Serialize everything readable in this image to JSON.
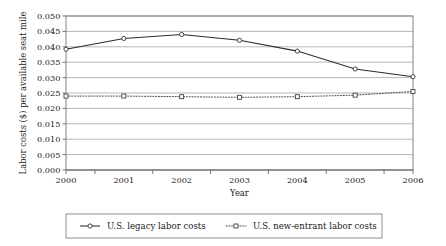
{
  "chart_data": {
    "type": "line",
    "title": "",
    "xlabel": "Year",
    "ylabel": "Labor costs ($) per available seat mile",
    "categories": [
      "2000",
      "2001",
      "2002",
      "2003",
      "2004",
      "2005",
      "2006"
    ],
    "x": [
      2000,
      2001,
      2002,
      2003,
      2004,
      2005,
      2006
    ],
    "ylim": [
      0.0,
      0.05
    ],
    "xlim": [
      2000,
      2006
    ],
    "yticks": [
      "0.000",
      "0.005",
      "0.010",
      "0.015",
      "0.020",
      "0.025",
      "0.030",
      "0.035",
      "0.040",
      "0.045",
      "0.050"
    ],
    "ytick_values": [
      0.0,
      0.005,
      0.01,
      0.015,
      0.02,
      0.025,
      0.03,
      0.035,
      0.04,
      0.045,
      0.05
    ],
    "grid": "horizontal",
    "legend_position": "bottom",
    "series": [
      {
        "name": "U.S. legacy labor costs",
        "marker": "circle",
        "linestyle": "solid",
        "color": "#2b2b2b",
        "values": [
          0.0392,
          0.0427,
          0.044,
          0.0421,
          0.0386,
          0.0328,
          0.0303
        ]
      },
      {
        "name": "U.S. new-entrant labor costs",
        "marker": "square",
        "linestyle": "dotted",
        "color": "#3a3a3a",
        "values": [
          0.024,
          0.024,
          0.0238,
          0.0236,
          0.0238,
          0.0243,
          0.0255
        ]
      }
    ]
  },
  "legend": {
    "entries": [
      {
        "label": "U.S. legacy labor costs",
        "marker": "circle-marker-icon",
        "line": "solid-line-icon"
      },
      {
        "label": "U.S. new-entrant labor costs",
        "marker": "square-marker-icon",
        "line": "dotted-line-icon"
      }
    ]
  },
  "colors": {
    "legacy": "#2b2b2b",
    "new_entrant": "#3a3a3a",
    "grid": "#9a9a9a",
    "border": "#777777",
    "background": "#ffffff"
  }
}
